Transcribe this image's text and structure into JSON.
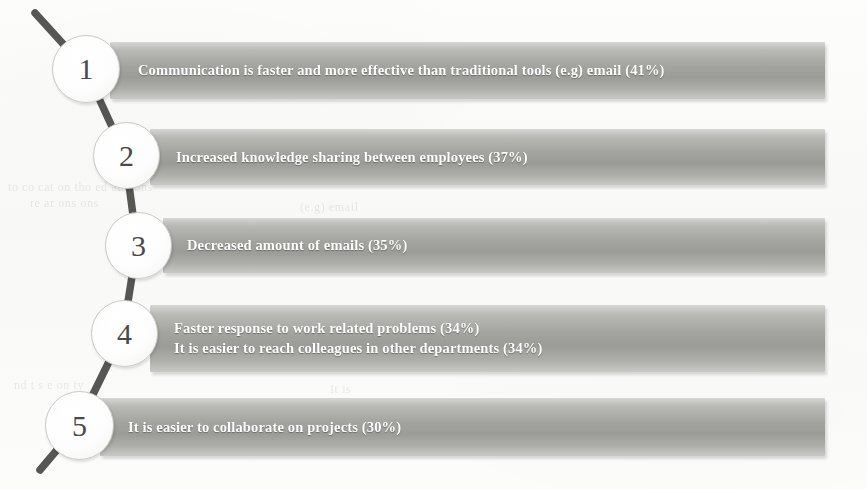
{
  "figure": {
    "kind": "ranked-list-infographic",
    "orientation": "vertical-descending",
    "accent_line_color": "#3f3f3d",
    "bar_color": "#a3a39f",
    "bar_text_color": "#fdfdfd",
    "node_fill_color": "#fdfdfd",
    "node_text_color": "#4a4a48",
    "background_color": "#fbfbfa"
  },
  "items": [
    {
      "rank": "1",
      "lines": [
        "Communication is faster and more effective than traditional tools (e.g) email  (41%)"
      ],
      "percent": "41%"
    },
    {
      "rank": "2",
      "lines": [
        "Increased knowledge sharing between employees  (37%)"
      ],
      "percent": "37%"
    },
    {
      "rank": "3",
      "lines": [
        "Decreased amount of emails   (35%)"
      ],
      "percent": "35%"
    },
    {
      "rank": "4",
      "lines": [
        "Faster response to work related problems   (34%)",
        "It is easier to reach colleagues in other departments  (34%)"
      ],
      "percent": "34%"
    },
    {
      "rank": "5",
      "lines": [
        "It is easier to collaborate on projects (30%)"
      ],
      "percent": "30%"
    }
  ],
  "ghost_text": {
    "line_a": "to co       cat on        tho       ed at  c        ons",
    "line_b": "re  ar           ons                   ons",
    "line_c": "nd          t  s            e      on           ty",
    "line_d": "(e.g)   email",
    "line_e": "It  is"
  }
}
